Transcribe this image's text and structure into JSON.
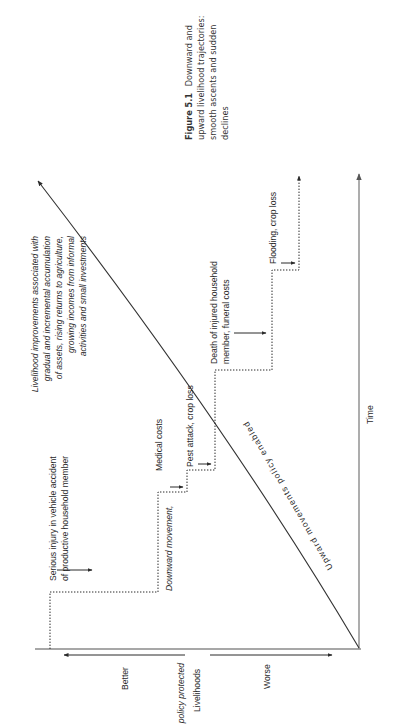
{
  "figure": {
    "caption_label": "Figure 5.1",
    "caption_lines": [
      "Downward and",
      "upward livelihood trajectories:",
      "smooth ascents and sudden",
      "declines"
    ]
  },
  "axes": {
    "x_axis_label": "Time",
    "y_axis_label": "Livelihoods",
    "y_better": "Better",
    "y_worse": "Worse"
  },
  "curve": {
    "label": "Upward movements policy enabled",
    "annotation_lines": [
      "Livelihood improvements associated with",
      "gradual and incremental accumulation",
      "of assets, rising returns to agriculture,",
      "growing incomes from informal",
      "activities and small investments"
    ]
  },
  "events": [
    {
      "id": "serious-injury",
      "lines": [
        "Serious injury in vehicle accident",
        "of productive household member"
      ]
    },
    {
      "id": "downward-protected",
      "lines": [
        "Downward movement,",
        "policy protected"
      ]
    },
    {
      "id": "medical-costs",
      "lines": [
        "Medical costs"
      ]
    },
    {
      "id": "pest-attack",
      "lines": [
        "Pest attack, crop loss"
      ]
    },
    {
      "id": "death",
      "lines": [
        "Death of injured household",
        "member, funeral costs"
      ]
    },
    {
      "id": "flooding",
      "lines": [
        "Flooding, crop loss"
      ]
    }
  ],
  "colors": {
    "axis": "#8a8a8a",
    "line": "#2b2b2b",
    "text": "#2a2a2a"
  }
}
